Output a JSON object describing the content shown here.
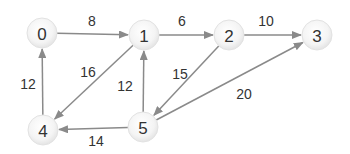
{
  "graph": {
    "type": "directed-weighted",
    "colors": {
      "edge": "#8a8a8a",
      "node_fill": "#f2f2f2",
      "node_stroke": "#e2e2e2",
      "text": "#333333"
    },
    "nodes": [
      {
        "id": "0",
        "label": "0",
        "x": 42,
        "y": 33
      },
      {
        "id": "1",
        "label": "1",
        "x": 144,
        "y": 35
      },
      {
        "id": "2",
        "label": "2",
        "x": 229,
        "y": 35
      },
      {
        "id": "3",
        "label": "3",
        "x": 317,
        "y": 35
      },
      {
        "id": "4",
        "label": "4",
        "x": 43,
        "y": 130
      },
      {
        "id": "5",
        "label": "5",
        "x": 143,
        "y": 127
      }
    ],
    "edges": [
      {
        "from": "0",
        "to": "1",
        "weight": "8",
        "label_x": 92,
        "label_y": 21
      },
      {
        "from": "1",
        "to": "2",
        "weight": "6",
        "label_x": 182,
        "label_y": 21
      },
      {
        "from": "2",
        "to": "3",
        "weight": "10",
        "label_x": 266,
        "label_y": 21
      },
      {
        "from": "1",
        "to": "4",
        "weight": "16",
        "label_x": 88,
        "label_y": 72
      },
      {
        "from": "5",
        "to": "1",
        "weight": "12",
        "label_x": 125,
        "label_y": 86
      },
      {
        "from": "2",
        "to": "5",
        "weight": "15",
        "label_x": 180,
        "label_y": 74
      },
      {
        "from": "5",
        "to": "3",
        "weight": "20",
        "label_x": 244,
        "label_y": 94
      },
      {
        "from": "4",
        "to": "0",
        "weight": "12",
        "label_x": 28,
        "label_y": 84
      },
      {
        "from": "5",
        "to": "4",
        "weight": "14",
        "label_x": 96,
        "label_y": 141
      }
    ]
  }
}
